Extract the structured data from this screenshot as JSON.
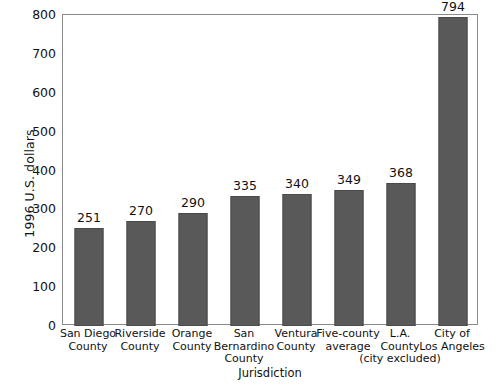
{
  "chart_data": {
    "type": "bar",
    "title": "",
    "xlabel": "Jurisdiction",
    "ylabel": "1996 U.S. dollars",
    "categories": [
      "San Diego County",
      "Riverside County",
      "Orange County",
      "San Bernardino County",
      "Ventura County",
      "Five-county average",
      "L.A. County (city excluded)",
      "City of Los Angeles"
    ],
    "category_lines": [
      [
        "San Diego",
        "County"
      ],
      [
        "Riverside",
        "County"
      ],
      [
        "Orange",
        "County"
      ],
      [
        "San",
        "Bernardino",
        "County"
      ],
      [
        "Ventura",
        "County"
      ],
      [
        "Five-county",
        "average"
      ],
      [
        "L.A.",
        "County",
        "(city excluded)"
      ],
      [
        "City of",
        "Los Angeles"
      ]
    ],
    "values": [
      251,
      270,
      290,
      335,
      340,
      349,
      368,
      794
    ],
    "value_labels": [
      "251",
      "270",
      "290",
      "335",
      "340",
      "349",
      "368",
      "794"
    ],
    "ylim": [
      0,
      800
    ],
    "yticks": [
      0,
      100,
      200,
      300,
      400,
      500,
      600,
      700,
      800
    ],
    "ytick_labels": [
      "0",
      "100",
      "200",
      "300",
      "400",
      "500",
      "600",
      "700",
      "800"
    ],
    "grid": false,
    "legend": false,
    "bar_color": "#595959",
    "bar_edge_color": "#4a4a4a",
    "frame_color": "#8a8a8a",
    "background": "#ffffff"
  }
}
